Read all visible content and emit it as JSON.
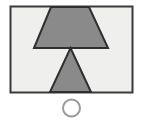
{
  "figure": {
    "canvas": {
      "width": 143,
      "height": 121,
      "background_color": "#ffffff"
    },
    "colors": {
      "shape_fill": "#8a8a8a",
      "shape_stroke": "#2f2f2f",
      "panel_fill": "#efefed",
      "panel_stroke": "#3a3a3a",
      "circle_stroke": "#9a9a9a"
    },
    "elements": [
      {
        "name": "panel-rectangle",
        "shape": "rectangle",
        "x": 10.5,
        "y": 6.5,
        "width": 122,
        "height": 86,
        "fill": "#efefed",
        "stroke": "#3a3a3a",
        "stroke_width": 2
      },
      {
        "name": "upper-trapezoid",
        "shape": "trapezoid",
        "points": "51,7 89,7 108,48 34,48",
        "orientation": "narrow-top-wide-bottom",
        "fill": "#8a8a8a",
        "stroke": "#2f2f2f",
        "stroke_width": 2
      },
      {
        "name": "lower-triangle",
        "shape": "triangle",
        "points": "70.5,48 91,92 50,92",
        "orientation": "apex-up",
        "fill": "#8a8a8a",
        "stroke": "#2f2f2f",
        "stroke_width": 2
      },
      {
        "name": "caption-circle",
        "shape": "circle",
        "cx": 71.5,
        "cy": 108,
        "r": 8.5,
        "fill": "none",
        "stroke": "#9a9a9a",
        "stroke_width": 2
      }
    ]
  }
}
